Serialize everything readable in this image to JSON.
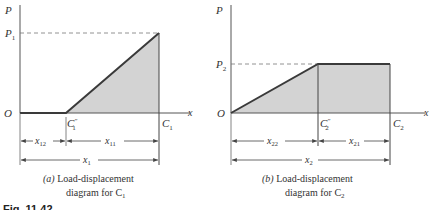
{
  "figure": {
    "label": "Fig. 11.42"
  },
  "panel_a": {
    "y_axis_label": "P",
    "x_axis_label": "x",
    "origin_label": "O",
    "peak_load_label": "P",
    "peak_load_sub": "1",
    "point_mid_label": "C",
    "point_mid_sub": "1",
    "point_mid_sup": "″",
    "point_end_label": "C",
    "point_end_sub": "1",
    "dim_left": "x",
    "dim_left_sub": "12",
    "dim_right": "x",
    "dim_right_sub": "11",
    "dim_total": "x",
    "dim_total_sub": "1",
    "caption_tag": "(a)",
    "caption_line1": " Load-displacement",
    "caption_line2": "diagram for C",
    "caption_sub": "1"
  },
  "panel_b": {
    "y_axis_label": "P",
    "x_axis_label": "x",
    "origin_label": "O",
    "peak_load_label": "P",
    "peak_load_sub": "2",
    "point_mid_label": "C",
    "point_mid_sub": "2",
    "point_mid_sup": "″",
    "point_end_label": "C",
    "point_end_sub": "2",
    "dim_left": "x",
    "dim_left_sub": "22",
    "dim_right": "x",
    "dim_right_sub": "21",
    "dim_total": "x",
    "dim_total_sub": "2",
    "caption_tag": "(b)",
    "caption_line1": " Load-displacement",
    "caption_line2": "diagram for C",
    "caption_sub": "2"
  },
  "colors": {
    "fill": "#d3d3d3",
    "line": "#3a3a3a",
    "axis": "#555555"
  }
}
